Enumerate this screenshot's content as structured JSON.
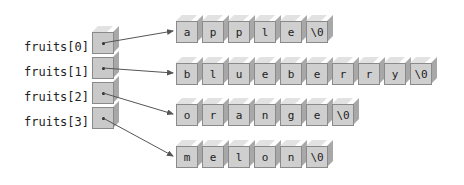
{
  "pointers": [
    {
      "label": "fruits[0]",
      "target_row": 0
    },
    {
      "label": "fruits[1]",
      "target_row": 1
    },
    {
      "label": "fruits[2]",
      "target_row": 2
    },
    {
      "label": "fruits[3]",
      "target_row": 3
    }
  ],
  "strings": [
    {
      "name": "apple",
      "chars": [
        "a",
        "p",
        "p",
        "l",
        "e",
        "\\0"
      ]
    },
    {
      "name": "blueberry",
      "chars": [
        "b",
        "l",
        "u",
        "e",
        "b",
        "e",
        "r",
        "r",
        "y",
        "\\0"
      ]
    },
    {
      "name": "orange",
      "chars": [
        "o",
        "r",
        "a",
        "n",
        "g",
        "e",
        "\\0"
      ]
    },
    {
      "name": "melon",
      "chars": [
        "m",
        "e",
        "l",
        "o",
        "n",
        "\\0"
      ]
    }
  ],
  "colors": {
    "cube_front": "#cfcfcf",
    "cube_top": "#e2e2e2",
    "cube_side": "#a8a8a8",
    "arrow": "#555555"
  }
}
